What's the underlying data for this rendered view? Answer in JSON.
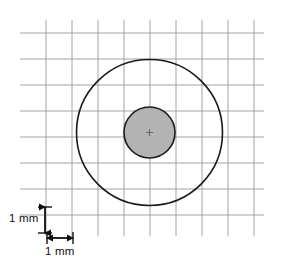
{
  "figure": {
    "background_color": "#ffffff",
    "width": 281,
    "height": 272
  },
  "grid": {
    "name": "millimeter-graph-paper",
    "line_color": "#9a9a9a",
    "line_width": 0.9,
    "cell_size_px": 26,
    "cell_size_value": 1,
    "cell_size_unit": "mm",
    "x_start": 20,
    "x_end": 264,
    "y_start": 20,
    "y_end": 236,
    "vertical_lines": [
      46,
      72,
      98,
      124,
      150,
      176,
      202,
      228,
      254
    ],
    "horizontal_lines": [
      33,
      59,
      85,
      111,
      137,
      163,
      189,
      215
    ]
  },
  "shapes": {
    "outer_circle": {
      "name": "outer-circle",
      "cx": 149.5,
      "cy": 132.5,
      "r": 73,
      "diameter_mm": 5.6,
      "stroke": "#1a1a1a",
      "stroke_width": 1.6,
      "fill": "none"
    },
    "inner_circle": {
      "name": "inner-circle",
      "cx": 149.5,
      "cy": 132.5,
      "r": 25.5,
      "diameter_mm": 2.0,
      "stroke": "#1a1a1a",
      "stroke_width": 1.6,
      "fill": "#b3b3b3"
    },
    "center_mark": {
      "name": "center-mark",
      "cx": 149.5,
      "cy": 132.5,
      "size": 7,
      "stroke": "#555555"
    }
  },
  "scale_bars": {
    "vertical": {
      "name": "vertical-scale-arrow",
      "label": "1 mm",
      "x": 45,
      "y_top": 207,
      "y_bottom": 233,
      "color": "#111111"
    },
    "horizontal": {
      "name": "horizontal-scale-arrow",
      "label": "1 mm",
      "y": 238,
      "x_left": 47,
      "x_right": 73,
      "color": "#111111"
    }
  }
}
